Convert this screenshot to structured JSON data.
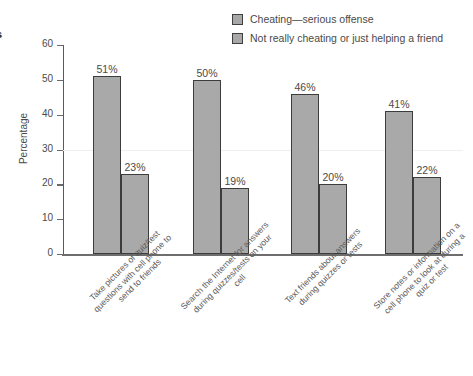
{
  "edge_caption": "s",
  "legend": {
    "position": "top-right",
    "items": [
      {
        "label": "Cheating—serious offense",
        "color": "#a9a9a9",
        "swatch": "legend-swatch-icon"
      },
      {
        "label": "Not really cheating or just helping a friend",
        "color": "#a9a9a9",
        "swatch": "legend-swatch-icon"
      }
    ]
  },
  "axes": {
    "ylabel": "Percentage",
    "yticks": [
      "0",
      "10",
      "20",
      "30",
      "40",
      "50",
      "60"
    ]
  },
  "chart_data": {
    "type": "bar",
    "title": "",
    "xlabel": "",
    "ylabel": "Percentage",
    "ylim": [
      0,
      60
    ],
    "yticks": [
      0,
      10,
      20,
      30,
      40,
      50,
      60
    ],
    "grid": true,
    "legend_position": "top-right",
    "categories": [
      "Take pictures of quiz/test questions with cell phone to send to friends",
      "Search the Internet for answers during quizzes/tests on your cell",
      "Text friends about answers during quizzes or tests",
      "Store notes or information on a cell phone to look at during a quiz or test"
    ],
    "series": [
      {
        "name": "Cheating—serious offense",
        "color": "#a9a9a9",
        "values": [
          51,
          50,
          46,
          41
        ],
        "labels": [
          "51%",
          "50%",
          "46%",
          "41%"
        ]
      },
      {
        "name": "Not really cheating or just helping a friend",
        "color": "#a9a9a9",
        "values": [
          23,
          19,
          20,
          22
        ],
        "labels": [
          "23%",
          "19%",
          "20%",
          "22%"
        ]
      }
    ]
  }
}
